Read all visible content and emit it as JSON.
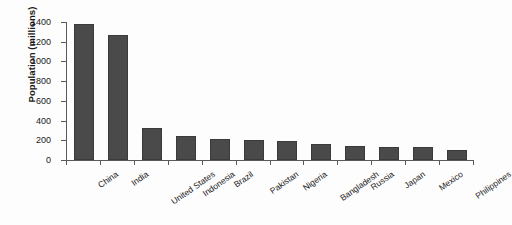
{
  "chart_data": {
    "type": "bar",
    "title": "",
    "xlabel": "",
    "ylabel": "Population (millions)",
    "categories": [
      "China",
      "India",
      "United States",
      "Indonesia",
      "Brazil",
      "Pakistan",
      "Nigeria",
      "Bangladesh",
      "Russia",
      "Japan",
      "Mexico",
      "Philippines"
    ],
    "values": [
      1380,
      1270,
      325,
      240,
      212,
      200,
      195,
      163,
      145,
      127,
      128,
      105
    ],
    "ylim": [
      0,
      1400
    ],
    "yticks": [
      0,
      200,
      400,
      600,
      800,
      1000,
      1200,
      1400
    ],
    "ytick_labels": [
      "0",
      "200",
      "400",
      "600",
      "800",
      "1000",
      "1200",
      "1400"
    ],
    "grid": false,
    "legend": null,
    "bar_color": "#4a4a4a",
    "axis_color": "#5a5a5a",
    "background": "#fdfdfd"
  }
}
